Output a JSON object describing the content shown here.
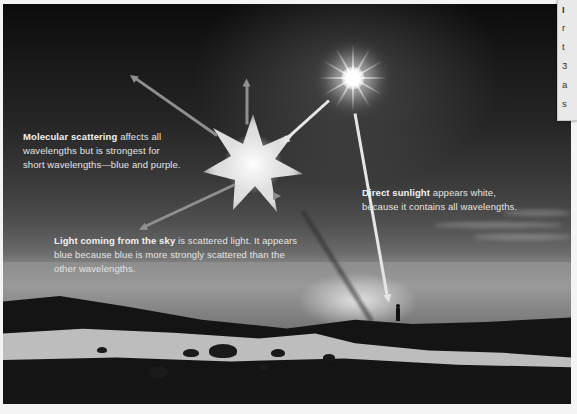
{
  "figure": {
    "style": "grayscale photograph with annotation arrows",
    "colors": {
      "sky_top": "#0c0c0c",
      "sky_mid": "#3b3b3b",
      "horizon": "#9a9a9a",
      "land": "#141414",
      "beach": "#bdbdbd",
      "label_text": "#e4e4e4",
      "arrow_gray": "#8f8f8f",
      "arrow_white": "#e6e6e6"
    }
  },
  "labels": {
    "molecular": {
      "bold": "Molecular scattering",
      "text": " affects all wavelengths but is strongest for short wavelengths—blue and purple."
    },
    "sky": {
      "bold": "Light coming from the sky",
      "text": " is scattered light. It appears blue because blue is more strongly scattered than the other wavelengths."
    },
    "direct": {
      "bold": "Direct sunlight",
      "text": " appears white, because it contains all wavelengths."
    }
  },
  "elements": {
    "sun": "sun-starburst",
    "scatter_point": "molecule-scattering-glow",
    "observer": "person-silhouette"
  },
  "arrows": [
    {
      "id": "sun-to-molecule",
      "type": "incoming-sunlight",
      "color": "white"
    },
    {
      "id": "scatter-up-left",
      "type": "scattered-light",
      "color": "gray"
    },
    {
      "id": "scatter-up",
      "type": "scattered-light",
      "color": "gray"
    },
    {
      "id": "scatter-down-left",
      "type": "scattered-light",
      "color": "gray"
    },
    {
      "id": "scatter-to-observer",
      "type": "scattered-light",
      "color": "gray"
    },
    {
      "id": "sun-to-observer",
      "type": "direct-sunlight",
      "color": "white"
    }
  ],
  "side_panel": {
    "visible_chars": [
      "I",
      "r",
      "t",
      "3",
      "a",
      "s"
    ]
  }
}
